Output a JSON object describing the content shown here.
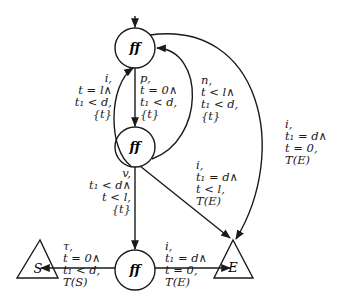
{
  "diagram": {
    "type": "state-transition-automaton",
    "nodes": {
      "top": {
        "label": "ff"
      },
      "middle": {
        "label": "ff"
      },
      "bottom": {
        "label": "ff"
      }
    },
    "terminals": {
      "S": {
        "label": "S"
      },
      "E": {
        "label": "E"
      }
    },
    "edges": {
      "i_top_mid": {
        "lines": [
          "i,",
          "t = l∧",
          "t₁ < d,",
          "{t}"
        ]
      },
      "p_top_mid": {
        "lines": [
          "p,",
          "t = 0∧",
          "t₁ < d,",
          "{t}"
        ]
      },
      "n_mid_top": {
        "lines": [
          "n,",
          "t < l∧",
          "t₁ < d,",
          "{t}"
        ]
      },
      "i_top_E": {
        "lines": [
          "i,",
          "t₁ = d∧",
          "t = 0,",
          "T(E)"
        ]
      },
      "i_mid_E": {
        "lines": [
          "i,",
          "t₁ = d∧",
          "t < l,",
          "T(E)"
        ]
      },
      "v_mid_bot": {
        "lines": [
          "v,",
          "t₁ < d∧",
          "t < l,",
          "{t}"
        ]
      },
      "tau_bot_S": {
        "lines": [
          "τ,",
          "t = 0∧",
          "t₁ < d,",
          "T(S)"
        ]
      },
      "i_bot_E": {
        "lines": [
          "i,",
          "t₁ = d∧",
          "t = 0,",
          "T(E)"
        ]
      }
    }
  }
}
